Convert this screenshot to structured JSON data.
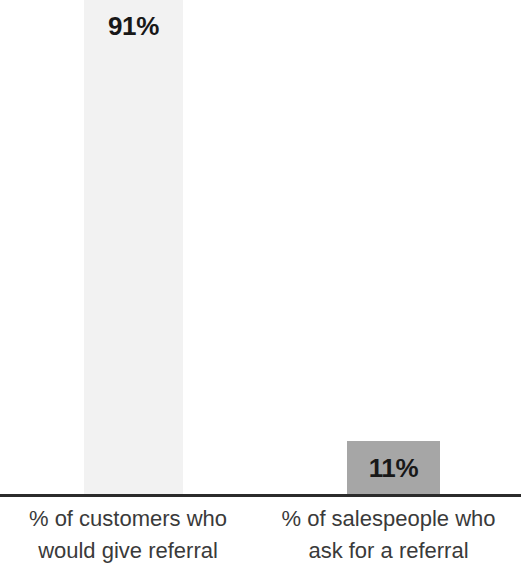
{
  "chart_data": {
    "type": "bar",
    "title": "",
    "subtitle": "",
    "xlabel": "",
    "ylabel": "",
    "grid": false,
    "legend": false,
    "axis_line": true,
    "ylim": [
      0,
      100
    ],
    "categories": [
      "% of customers who would give referral",
      "% of salespeople who ask for a referral"
    ],
    "values": [
      91,
      11
    ],
    "value_labels": [
      "91%",
      "11%"
    ],
    "colors": [
      "#f2f2f2",
      "#a6a6a6"
    ],
    "background": "#ffffff",
    "axis_color": "#2b2b2b",
    "label_color": "#3a3a3a",
    "value_label_color": "#181818"
  },
  "bars": [
    {
      "value_label": "91%",
      "line1": "% of customers who",
      "line2": "would give referral"
    },
    {
      "value_label": "11%",
      "line1": "% of salespeople who",
      "line2": "ask for a referral"
    }
  ]
}
